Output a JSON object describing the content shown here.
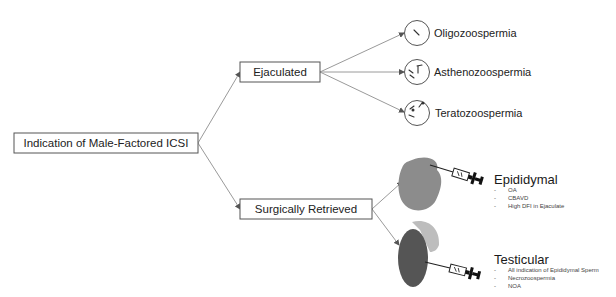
{
  "diagram": {
    "root": {
      "label": "Indication of Male-Factored ICSI"
    },
    "branches": [
      {
        "label": "Ejaculated",
        "children": [
          {
            "label": "Oligozoospermia",
            "icon": "sparse-sperm-circle-icon"
          },
          {
            "label": "Asthenozoospermia",
            "icon": "immotile-sperm-circle-icon"
          },
          {
            "label": "Teratozoospermia",
            "icon": "abnormal-sperm-circle-icon"
          }
        ]
      },
      {
        "label": "Surgically Retrieved",
        "children": [
          {
            "label": "Epididymal",
            "icon": "epididymis-syringe-icon",
            "bullets": [
              "OA",
              "CBAVD",
              "High DFI in Ejaculate"
            ]
          },
          {
            "label": "Testicular",
            "icon": "testis-syringe-icon",
            "bullets": [
              "All indication of Epididymal Sperm",
              "Necrozoospermia",
              "NOA"
            ]
          }
        ]
      }
    ],
    "bullet_char": "-",
    "colors": {
      "edge": "#9a9a9a",
      "box_border": "#555555",
      "epididymis_fill": "#8c8c8c",
      "testis_fill": "#555555",
      "testis_cap": "#bdbdbd",
      "syringe_plunger": "#111111"
    }
  }
}
